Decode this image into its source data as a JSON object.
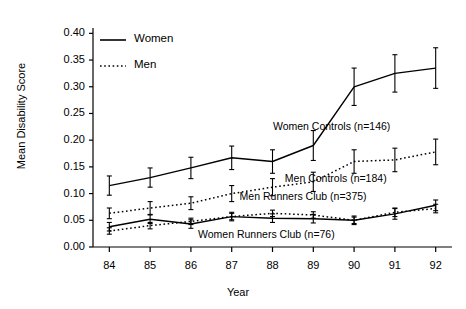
{
  "chart_data": {
    "type": "line",
    "title": "",
    "xlabel": "Year",
    "ylabel": "Mean Disability Score",
    "x": [
      84,
      85,
      86,
      87,
      88,
      89,
      90,
      91,
      92
    ],
    "xtick_labels": [
      "84",
      "85",
      "86",
      "87",
      "88",
      "89",
      "90",
      "91",
      "92"
    ],
    "xlim": [
      83.6,
      92.4
    ],
    "ylim": [
      0.0,
      0.41
    ],
    "ytick_labels": [
      "0.00",
      "0.05",
      "0.10",
      "0.15",
      "0.20",
      "0.25",
      "0.30",
      "0.35",
      "0.40"
    ],
    "yticks": [
      0.0,
      0.05,
      0.1,
      0.15,
      0.2,
      0.25,
      0.3,
      0.35,
      0.4
    ],
    "grid": false,
    "legend_position": "upper-left",
    "error_bars": true,
    "series": [
      {
        "name": "Women Controls (n=146)",
        "linestyle": "solid",
        "sex": "Women",
        "values": [
          0.115,
          0.13,
          0.148,
          0.167,
          0.16,
          0.19,
          0.3,
          0.325,
          0.335
        ],
        "errors": [
          0.018,
          0.018,
          0.02,
          0.022,
          0.022,
          0.028,
          0.035,
          0.035,
          0.038
        ],
        "annotation": "Women Controls (n=146)"
      },
      {
        "name": "Men Controls (n=184)",
        "linestyle": "dotted",
        "sex": "Men",
        "values": [
          0.063,
          0.073,
          0.082,
          0.1,
          0.112,
          0.122,
          0.16,
          0.163,
          0.178
        ],
        "errors": [
          0.01,
          0.012,
          0.012,
          0.015,
          0.016,
          0.018,
          0.022,
          0.022,
          0.024
        ],
        "annotation": "Men Controls (n=184)"
      },
      {
        "name": "Men Runners Club (n=375)",
        "linestyle": "dotted",
        "sex": "Men",
        "values": [
          0.03,
          0.04,
          0.048,
          0.057,
          0.063,
          0.06,
          0.05,
          0.065,
          0.072
        ],
        "errors": [
          0.006,
          0.006,
          0.006,
          0.006,
          0.006,
          0.006,
          0.006,
          0.008,
          0.008
        ],
        "annotation": "Men Runners Club (n=375)"
      },
      {
        "name": "Women Runners Club (n=76)",
        "linestyle": "solid",
        "sex": "Women",
        "values": [
          0.038,
          0.052,
          0.043,
          0.057,
          0.054,
          0.053,
          0.05,
          0.062,
          0.078
        ],
        "errors": [
          0.008,
          0.008,
          0.008,
          0.008,
          0.008,
          0.008,
          0.008,
          0.01,
          0.01
        ],
        "annotation": "Women Runners Club (n=76)"
      }
    ],
    "legend": [
      {
        "label": "Women",
        "linestyle": "solid"
      },
      {
        "label": "Men",
        "linestyle": "dotted"
      }
    ],
    "annotations": [
      {
        "text": "Women Controls (n=146)",
        "x": 89.45,
        "y": 0.225
      },
      {
        "text": "Men Controls (n=184)",
        "x": 89.55,
        "y": 0.128
      },
      {
        "text": "Men Runners Club (n=375)",
        "x": 88.75,
        "y": 0.094
      },
      {
        "text": "Women Runners Club (n=76)",
        "x": 87.85,
        "y": 0.022
      }
    ]
  }
}
